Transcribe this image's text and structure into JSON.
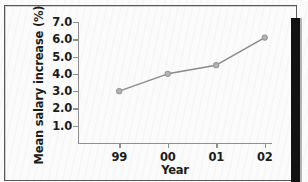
{
  "figure": {
    "background_color": "#fbfbfb",
    "border_color": "#585858",
    "right_bar_color": "#121212"
  },
  "chart_data": {
    "type": "line",
    "title": "",
    "subtitle": "",
    "xlabel": "Year",
    "ylabel": "Mean salary increase (%)",
    "categories": [
      "99",
      "00",
      "01",
      "02"
    ],
    "values": [
      3.0,
      4.0,
      4.5,
      6.1
    ],
    "series": [
      {
        "name": "Mean salary increase",
        "values": [
          3.0,
          4.0,
          4.5,
          6.1
        ],
        "color": "#8a8a8a",
        "marker": "circle"
      }
    ],
    "ylim": [
      0.0,
      7.0
    ],
    "yticks": [
      1.0,
      2.0,
      3.0,
      4.0,
      5.0,
      6.0,
      7.0
    ],
    "ytick_labels": [
      "1.0",
      "2.0",
      "3.0",
      "4.0",
      "5.0",
      "6.0",
      "7.0"
    ],
    "xticks": [
      "99",
      "00",
      "01",
      "02"
    ],
    "grid": false,
    "legend": false,
    "legend_position": "none",
    "line_color": "#8a8a8a",
    "marker_color": "#9a9a9a",
    "axis_color": "#8f8f8f"
  }
}
